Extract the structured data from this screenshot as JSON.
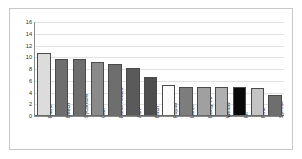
{
  "card": {
    "unit_label": "[MPa]"
  },
  "chart_data": {
    "type": "bar",
    "title": "Tangential shear strength perpendicular to the grain",
    "xlabel": "",
    "ylabel": "[MPa]",
    "ylim": [
      0,
      16
    ],
    "yticks": [
      16,
      14,
      12,
      10,
      8,
      6,
      4,
      2,
      0
    ],
    "grid": true,
    "legend": "none",
    "categories": [
      "Plane",
      "Beech",
      "Sycamore",
      "Oak",
      "False Acacia",
      "Ash",
      "Birch",
      "Poplar",
      "Larch",
      "Doug. Fir",
      "Willow",
      "Fir",
      "Pine",
      "Spruce"
    ],
    "values": [
      10.8,
      9.7,
      9.7,
      9.2,
      8.9,
      8.2,
      6.7,
      5.3,
      4.9,
      4.9,
      4.9,
      4.9,
      4.7,
      3.6
    ],
    "bar_colors": [
      "#dcdcdc",
      "#6e6e6e",
      "#6e6e6e",
      "#8a8a8a",
      "#6e6e6e",
      "#5a5a5a",
      "#4e4e4e",
      "#fbfbfb",
      "#7d7d7d",
      "#a0a0a0",
      "#b0b0b0",
      "#0a0a0a",
      "#c4c4c4",
      "#6e6e6e"
    ]
  }
}
